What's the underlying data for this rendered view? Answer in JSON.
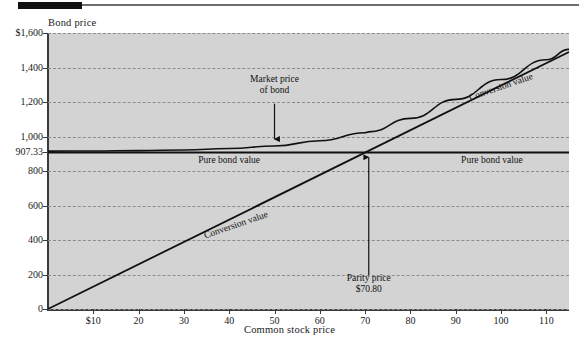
{
  "figure": {
    "header_bar": "decorative-black-bar",
    "header_rule": "decorative-gray-rule"
  },
  "chart_data": {
    "type": "line",
    "title": "",
    "xlabel": "Common stock price",
    "ylabel": "Bond price",
    "xlim": [
      0,
      115
    ],
    "ylim": [
      0,
      1600
    ],
    "grid": true,
    "legend": "none",
    "x_ticks": [
      10,
      20,
      30,
      40,
      50,
      60,
      70,
      80,
      90,
      100,
      110
    ],
    "x_tick_labels": [
      "$10",
      "20",
      "30",
      "40",
      "50",
      "60",
      "70",
      "80",
      "90",
      "100",
      "110"
    ],
    "y_ticks": [
      0,
      200,
      400,
      600,
      800,
      907.33,
      1000,
      1200,
      1400,
      1600
    ],
    "y_tick_labels": [
      "0",
      "200",
      "400",
      "600",
      "800",
      "907.33",
      "1,000",
      "1,200",
      "1,400",
      "$1,600"
    ],
    "series": [
      {
        "name": "Pure bond value",
        "type": "horizontal-line",
        "value": 907.33,
        "x": [
          0,
          115
        ],
        "y": [
          907.33,
          907.33
        ]
      },
      {
        "name": "Conversion value",
        "type": "line",
        "x": [
          0,
          115
        ],
        "y": [
          0,
          1490
        ]
      },
      {
        "name": "Market price of bond",
        "type": "curve",
        "x": [
          0,
          10,
          20,
          30,
          40,
          50,
          60,
          70,
          70.8,
          80,
          90,
          100,
          110,
          115
        ],
        "y": [
          915,
          916,
          918,
          922,
          930,
          945,
          975,
          1022,
          1027,
          1105,
          1215,
          1330,
          1445,
          1505
        ]
      }
    ],
    "annotations": [
      {
        "name": "market-price-of-bond",
        "text_line1": "Market price",
        "text_line2": "of bond",
        "arrow": "down",
        "points_to_x": 50,
        "points_to_y": 945
      },
      {
        "name": "pure-bond-value-left",
        "text": "Pure bond value"
      },
      {
        "name": "pure-bond-value-right",
        "text": "Pure bond value"
      },
      {
        "name": "conversion-value-lower",
        "text": "Conversion value"
      },
      {
        "name": "conversion-value-upper",
        "text": "Conversion value"
      },
      {
        "name": "parity-price",
        "text_line1": "Parity price",
        "text_line2": "$70.80",
        "arrow": "up",
        "points_to_x": 70.8,
        "points_to_y": 907.33
      }
    ],
    "colors": {
      "plot_background": "#d3d3d3",
      "page_background": "#ffffff",
      "line": "#111111",
      "grid": "#8c8c8c",
      "axis": "#3a3a3a",
      "text": "#1a1a1a"
    }
  }
}
